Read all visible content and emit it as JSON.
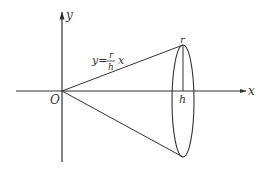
{
  "diagram": {
    "axes": {
      "x_label": "x",
      "y_label": "y",
      "origin_label": "O"
    },
    "line_equation": {
      "lhs": "y=",
      "numerator": "r",
      "denominator": "h",
      "variable": "x"
    },
    "labels": {
      "radius": "r",
      "height": "h"
    },
    "colors": {
      "stroke": "#333333",
      "background": "#ffffff"
    }
  }
}
